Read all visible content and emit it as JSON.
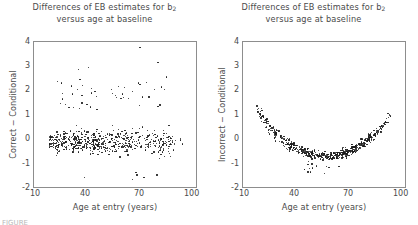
{
  "figure": {
    "width": 418,
    "height": 225,
    "background": "#ffffff",
    "point_color": "#1a1a1a",
    "axis_color": "#8d8d8d",
    "text_color": "#4a4a4a",
    "caption_partial": "FIGURE"
  },
  "panels": [
    {
      "id": "left",
      "title_line1": "Differences of EB estimates for b",
      "title_sub": "2",
      "title_line2": "versus age at baseline",
      "ylabel": "Correct − Conditional",
      "xlabel": "Age at entry (years)",
      "yticks": [
        "4",
        "3",
        "2",
        "1",
        "0",
        "-1",
        "-2"
      ],
      "xticks": [
        "10",
        "40",
        "70",
        "100"
      ]
    },
    {
      "id": "right",
      "title_line1": "Differences of EB estimates for b",
      "title_sub": "2",
      "title_line2": "versus age at baseline",
      "ylabel": "Incorrect − Conditional",
      "xlabel": "Age at entry (years)",
      "yticks": [
        "4",
        "3",
        "2",
        "1",
        "0",
        "-1",
        "-2"
      ],
      "xticks": [
        "10",
        "40",
        "70",
        "100"
      ]
    }
  ],
  "chart_data": [
    {
      "type": "scatter",
      "panel": "left",
      "title": "Differences of EB estimates for b2 versus age at baseline",
      "xlabel": "Age at entry (years)",
      "ylabel": "Correct - Conditional",
      "xlim": [
        10,
        100
      ],
      "ylim": [
        -2,
        4
      ],
      "xticks": [
        10,
        40,
        70,
        100
      ],
      "yticks": [
        -2,
        -1,
        0,
        1,
        2,
        3,
        4
      ],
      "grid": false,
      "legend": "none",
      "marker_size": 1.3,
      "n_points": 560,
      "description": "Unstructured scatter cloud centred near zero across all ages; dense core between ages 20 and 45 around y = -0.1, spread roughly -1.5 to 1.5, with a sparse upper tail of outliers reaching y = 3.8.",
      "x": [
        14.2,
        15.1,
        15.8,
        16.4,
        16.9,
        17.3,
        17.8,
        18.2,
        18.6,
        19.0,
        19.3,
        19.7,
        20.0,
        20.3,
        20.6,
        20.9,
        21.2,
        21.5,
        21.8,
        22.0,
        22.3,
        22.6,
        22.8,
        23.1,
        23.3,
        23.6,
        23.8,
        24.0,
        24.3,
        24.5,
        24.7,
        24.9,
        25.1,
        25.4,
        25.6,
        25.8,
        26.0,
        26.2,
        26.4,
        26.6,
        26.8,
        27.0,
        27.2,
        27.4,
        27.5,
        27.7,
        27.9,
        28.1,
        28.3,
        28.4,
        28.6,
        28.8,
        29.0,
        29.1,
        29.3,
        29.5,
        29.6,
        29.8,
        30.0,
        30.1,
        30.3,
        30.4,
        30.6,
        30.8,
        30.9,
        31.1,
        31.2,
        31.4,
        31.5,
        31.7,
        31.8,
        32.0,
        32.1,
        32.3,
        32.4,
        32.6,
        32.7,
        32.9,
        33.0,
        33.2,
        33.3,
        33.4,
        33.6,
        33.7,
        33.9,
        34.0,
        34.2,
        34.3,
        34.4,
        34.6,
        34.7,
        34.9,
        35.0,
        35.1,
        35.3,
        35.4,
        35.5,
        35.7,
        35.8,
        36.0,
        36.1,
        36.2,
        36.4,
        36.5,
        36.6,
        36.8,
        36.9,
        37.0,
        37.2,
        37.3,
        37.4,
        37.6,
        37.7,
        37.8,
        38.0,
        38.1,
        38.2,
        38.4,
        38.5,
        38.6,
        38.8,
        38.9,
        39.0,
        39.2,
        39.3,
        39.4,
        39.6,
        39.7,
        39.8,
        40.0,
        40.1,
        40.2,
        40.4,
        40.5,
        40.6,
        40.8,
        40.9,
        41.0,
        41.2,
        41.3,
        41.4,
        41.6,
        41.7,
        41.8,
        42.0,
        42.1,
        42.2,
        42.4,
        42.5,
        42.6,
        42.8,
        42.9,
        43.0,
        43.2,
        43.3,
        43.4,
        43.6,
        43.7,
        43.9,
        44.0,
        44.1,
        44.3,
        44.4,
        44.5,
        44.7,
        44.8,
        44.9,
        45.1,
        45.2,
        45.3,
        45.5,
        45.6,
        45.7,
        45.9,
        46.0,
        46.2,
        46.3,
        46.4,
        46.6,
        46.7,
        46.8,
        47.0,
        47.1,
        47.2,
        47.4,
        47.5,
        47.7,
        47.8,
        47.9,
        48.1,
        48.2,
        48.3,
        48.5,
        48.6,
        48.8,
        48.9,
        49.0,
        49.2,
        49.3,
        49.4,
        49.6,
        49.7,
        49.9,
        50.0,
        50.1,
        50.3,
        50.4,
        50.6,
        50.7,
        50.8,
        51.0,
        51.1,
        51.3,
        51.4,
        51.5,
        51.7,
        51.8,
        52.0,
        52.1,
        52.2,
        52.4,
        52.5,
        52.7,
        52.8,
        52.9,
        53.1,
        53.2,
        53.4,
        53.5,
        53.7,
        53.8,
        53.9,
        54.1,
        54.2,
        54.4,
        54.5,
        54.7,
        54.8,
        54.9,
        55.1,
        55.2,
        55.4,
        55.5,
        55.7,
        55.8,
        56.0,
        56.1,
        56.2,
        56.4,
        56.5,
        56.7,
        56.8,
        57.0,
        57.1,
        57.3,
        57.4,
        57.6,
        57.7,
        57.9,
        58.0,
        58.2,
        58.3,
        58.5,
        58.6,
        58.8,
        58.9,
        59.1,
        59.2,
        59.4,
        59.5,
        59.7,
        59.8,
        60.0,
        60.1,
        60.3,
        60.5,
        60.6,
        60.8,
        60.9,
        61.1,
        61.2,
        61.4,
        61.6,
        61.7,
        61.9,
        62.0,
        62.2,
        62.4,
        62.5,
        62.7,
        62.8,
        63.0,
        63.2,
        63.3,
        63.5,
        63.7,
        63.8,
        64.0,
        64.2,
        64.3,
        64.5,
        64.7,
        64.8,
        65.0,
        65.2,
        65.3,
        65.5,
        65.7,
        65.9,
        66.0,
        66.2,
        66.4,
        66.6,
        66.7,
        66.9,
        67.1,
        67.3,
        67.4,
        67.6,
        67.8,
        68.0,
        68.2,
        68.3,
        68.5,
        68.7,
        68.9,
        69.1,
        69.3,
        69.5,
        69.6,
        69.8,
        70.0,
        70.2,
        70.4,
        70.6,
        70.8,
        71.0,
        71.2,
        71.4,
        71.6,
        71.8,
        72.0,
        72.2,
        72.4,
        72.6,
        72.8,
        73.0,
        73.2,
        73.4,
        73.6,
        73.8,
        74.1,
        74.3,
        74.5,
        74.7,
        74.9,
        75.1,
        75.4,
        75.6,
        75.8,
        76.0,
        76.3,
        76.5,
        76.7,
        77.0,
        77.2,
        77.4,
        77.7,
        77.9,
        78.2,
        78.4,
        78.7,
        78.9,
        79.2,
        79.4,
        79.7,
        80.0,
        80.2,
        80.5,
        80.8,
        81.0,
        81.3,
        81.6,
        81.9,
        82.2,
        82.5,
        82.8,
        83.1,
        83.4,
        83.7,
        84.1,
        84.4,
        84.7,
        85.1,
        85.4,
        85.8,
        86.1,
        86.5,
        86.9,
        87.3,
        87.7,
        88.1,
        88.5,
        88.9,
        89.4,
        89.8,
        90.3
      ],
      "y_range_core": [
        -1.2,
        1.2
      ],
      "y_mean": -0.05,
      "outliers_high": [
        3.8,
        3.2,
        3.0,
        2.9,
        2.6,
        2.5,
        2.4,
        2.2,
        2.1,
        2.0
      ],
      "outliers_low": [
        -1.6,
        -1.5,
        -1.5,
        -1.4,
        -1.4,
        -1.3
      ]
    },
    {
      "type": "scatter",
      "panel": "right",
      "title": "Differences of EB estimates for b2 versus age at baseline",
      "xlabel": "Age at entry (years)",
      "ylabel": "Incorrect - Conditional",
      "xlim": [
        10,
        100
      ],
      "ylim": [
        -2,
        4
      ],
      "xticks": [
        10,
        40,
        70,
        100
      ],
      "yticks": [
        -2,
        -1,
        0,
        1,
        2,
        3,
        4
      ],
      "grid": false,
      "legend": "none",
      "marker_size": 1.3,
      "n_points": 560,
      "description": "Tight U-shaped (parabolic) band: values start near y = 1.4 at age 17, fall to a minimum of about y = -0.65 near age 55, then rise again to about y = 2.0 by age 90. Scatter about the curve is narrow (roughly +/-0.25) and widens slightly at both ends.",
      "curve": {
        "form": "quadratic",
        "vertex_x": 55,
        "vertex_y": -0.65,
        "curvature": 0.0013
      },
      "band_halfwidth": 0.22,
      "y_at_x": [
        {
          "x": 17,
          "y": 1.35
        },
        {
          "x": 20,
          "y": 1.0
        },
        {
          "x": 25,
          "y": 0.5
        },
        {
          "x": 30,
          "y": 0.15
        },
        {
          "x": 35,
          "y": -0.15
        },
        {
          "x": 40,
          "y": -0.4
        },
        {
          "x": 45,
          "y": -0.55
        },
        {
          "x": 50,
          "y": -0.63
        },
        {
          "x": 55,
          "y": -0.65
        },
        {
          "x": 60,
          "y": -0.6
        },
        {
          "x": 65,
          "y": -0.45
        },
        {
          "x": 70,
          "y": -0.2
        },
        {
          "x": 75,
          "y": 0.15
        },
        {
          "x": 80,
          "y": 0.6
        },
        {
          "x": 85,
          "y": 1.2
        },
        {
          "x": 90,
          "y": 1.9
        }
      ]
    }
  ]
}
